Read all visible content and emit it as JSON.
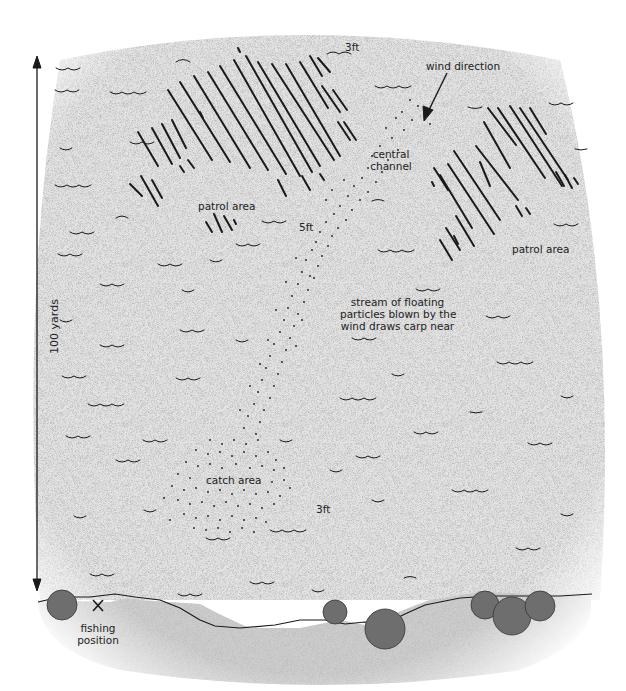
{
  "diagram": {
    "colors": {
      "water": "#e6e6e6",
      "bank": "#cfcfcf",
      "ink": "#1a1a1a",
      "bush": "#6b6b6b"
    },
    "scale": {
      "label": "100 yards",
      "arrow": "vertical-double-arrow"
    },
    "labels": {
      "wind_direction": "wind direction",
      "central_channel_line1": "central",
      "central_channel_line2": "channel",
      "patrol_area_left": "patrol area",
      "patrol_area_right": "patrol area",
      "depth_top": "3ft",
      "depth_middle": "5ft",
      "depth_bottom": "3ft",
      "stream_line1": "stream of floating",
      "stream_line2": "particles blown by the",
      "stream_line3": "wind draws carp near",
      "catch_area": "catch area",
      "fishing_position_line1": "fishing",
      "fishing_position_line2": "position",
      "fishing_marker": "X"
    },
    "regions": [
      {
        "name": "patrol-area-left",
        "type": "hatched"
      },
      {
        "name": "patrol-area-right",
        "type": "hatched"
      },
      {
        "name": "central-channel",
        "type": "dotted-stream"
      },
      {
        "name": "catch-area",
        "type": "dotted-cluster"
      },
      {
        "name": "bank",
        "type": "shoreline",
        "bushes": 6
      }
    ]
  }
}
